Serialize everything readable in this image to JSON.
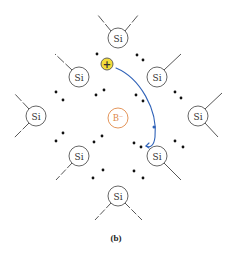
{
  "figure": {
    "caption": "(b)",
    "colors": {
      "atom_outline": "#555555",
      "bond": "#444444",
      "electron": "#111111",
      "boron": "#e08a4a",
      "hole_fill": "#f3dc3a",
      "hole_stroke": "#555555",
      "arrow": "#2f62b8"
    }
  },
  "atoms": {
    "si_label": "Si",
    "dopant_label": "B⁻",
    "hole_label": "+",
    "silicon": [
      {
        "id": "top",
        "x": 118,
        "y": 38
      },
      {
        "id": "upper-left",
        "x": 79,
        "y": 77
      },
      {
        "id": "upper-right",
        "x": 157,
        "y": 77
      },
      {
        "id": "left",
        "x": 36,
        "y": 116
      },
      {
        "id": "right",
        "x": 198,
        "y": 116
      },
      {
        "id": "lower-left",
        "x": 79,
        "y": 156
      },
      {
        "id": "lower-right",
        "x": 157,
        "y": 156
      },
      {
        "id": "bottom",
        "x": 118,
        "y": 196
      }
    ],
    "boron": {
      "x": 118,
      "y": 118
    },
    "hole": {
      "x": 107,
      "y": 64
    }
  }
}
